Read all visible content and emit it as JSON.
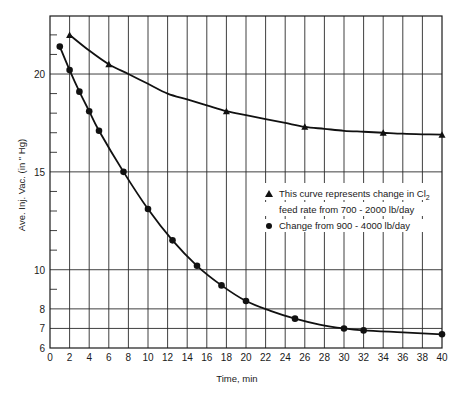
{
  "chart_data": {
    "type": "line",
    "title": "",
    "xlabel": "Time, min",
    "ylabel": "Ave. Inj. Vac. (in \" Hg)",
    "xlim": [
      0,
      40
    ],
    "ylim": [
      6,
      23
    ],
    "grid": true,
    "x_ticks": [
      0,
      2,
      4,
      6,
      8,
      10,
      12,
      14,
      16,
      18,
      20,
      22,
      24,
      26,
      28,
      30,
      32,
      34,
      36,
      38,
      40
    ],
    "y_tick_labels": [
      {
        "value": 20,
        "label": "20"
      },
      {
        "value": 15,
        "label": "15"
      },
      {
        "value": 10,
        "label": "10"
      },
      {
        "value": 8,
        "label": "8"
      },
      {
        "value": 7,
        "label": "7"
      },
      {
        "value": 6,
        "label": "6"
      }
    ],
    "y_minor_ticks": [
      9,
      11,
      12,
      13,
      14,
      16,
      17,
      18,
      19,
      21,
      22
    ],
    "y_gridlines": [
      7,
      8,
      10,
      15,
      20
    ],
    "legend_position": "inside right, middle",
    "series": [
      {
        "name": "This curve represents change in Cl2 feed rate from 700 - 2000 lb/day",
        "marker": "triangle",
        "points": [
          [
            2,
            22.0
          ],
          [
            6,
            20.5
          ],
          [
            18,
            18.1
          ],
          [
            26,
            17.3
          ],
          [
            34,
            17.0
          ],
          [
            40,
            16.9
          ]
        ],
        "curve": [
          [
            2,
            22.0
          ],
          [
            4,
            21.2
          ],
          [
            6,
            20.5
          ],
          [
            8,
            20.0
          ],
          [
            10,
            19.5
          ],
          [
            12,
            19.0
          ],
          [
            14,
            18.7
          ],
          [
            16,
            18.4
          ],
          [
            18,
            18.1
          ],
          [
            20,
            17.9
          ],
          [
            22,
            17.7
          ],
          [
            24,
            17.5
          ],
          [
            26,
            17.3
          ],
          [
            28,
            17.2
          ],
          [
            30,
            17.1
          ],
          [
            32,
            17.05
          ],
          [
            34,
            17.0
          ],
          [
            36,
            16.95
          ],
          [
            38,
            16.92
          ],
          [
            40,
            16.9
          ]
        ]
      },
      {
        "name": "Change from 900 - 4000 lb/day",
        "marker": "circle",
        "points": [
          [
            1,
            21.4
          ],
          [
            2,
            20.2
          ],
          [
            3,
            19.1
          ],
          [
            4,
            18.1
          ],
          [
            5,
            17.1
          ],
          [
            7.5,
            15.0
          ],
          [
            10,
            13.1
          ],
          [
            12.5,
            11.5
          ],
          [
            15,
            10.2
          ],
          [
            17.5,
            9.2
          ],
          [
            20,
            8.4
          ],
          [
            25,
            7.5
          ],
          [
            30,
            7.0
          ],
          [
            32,
            6.9
          ],
          [
            40,
            6.7
          ]
        ],
        "curve": [
          [
            1,
            21.4
          ],
          [
            2,
            20.2
          ],
          [
            3,
            19.1
          ],
          [
            4,
            18.1
          ],
          [
            5,
            17.1
          ],
          [
            7.5,
            15.0
          ],
          [
            10,
            13.1
          ],
          [
            12.5,
            11.5
          ],
          [
            15,
            10.2
          ],
          [
            17.5,
            9.2
          ],
          [
            20,
            8.4
          ],
          [
            22.5,
            7.9
          ],
          [
            25,
            7.5
          ],
          [
            27.5,
            7.2
          ],
          [
            30,
            7.0
          ],
          [
            32,
            6.9
          ],
          [
            36,
            6.8
          ],
          [
            40,
            6.7
          ]
        ]
      }
    ]
  },
  "legend": {
    "line1_prefix": "This curve represents change in Cl",
    "line1_sub": "2",
    "line2": "feed rate from 700 - 2000 lb/day",
    "line3": "Change from 900 - 4000 lb/day"
  },
  "colors": {
    "ink": "#111111",
    "background": "#ffffff"
  }
}
